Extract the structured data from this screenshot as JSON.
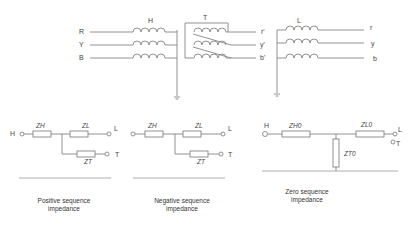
{
  "top_diagram": {
    "title": "Three-winding transformer connection",
    "input_phases": [
      "R",
      "Y",
      "B"
    ],
    "winding_h_label": "H",
    "winding_t_label": "T",
    "winding_l_label": "L",
    "tertiary_phases": [
      "r'",
      "y'",
      "b'"
    ],
    "output_phases": [
      "r",
      "y",
      "b"
    ]
  },
  "circuits": [
    {
      "caption_line1": "Positive sequence",
      "caption_line2": "impedance",
      "node_h": "H",
      "node_l": "L",
      "node_t": "T",
      "z_h": "ZH",
      "z_l": "ZL",
      "z_t": "ZT"
    },
    {
      "caption_line1": "Negative sequence",
      "caption_line2": "impedance",
      "node_l": "L",
      "node_t": "T",
      "z_h": "ZH",
      "z_l": "ZL",
      "z_t": "ZT"
    },
    {
      "caption_line1": "Zero sequence",
      "caption_line2": "impedance",
      "node_h": "H",
      "node_l": "L",
      "node_t": "T",
      "z_h": "ZH0",
      "z_l": "ZL0",
      "z_t": "ZT0"
    }
  ]
}
